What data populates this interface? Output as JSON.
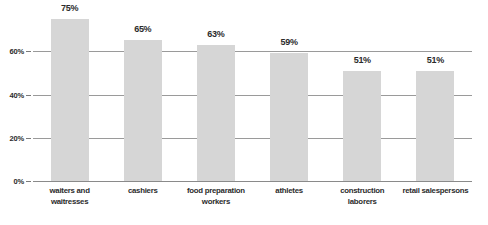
{
  "chart_data": {
    "type": "bar",
    "title": "",
    "subtitle": "",
    "xlabel": "",
    "ylabel": "",
    "categories": [
      "waiters and waitresses",
      "cashiers",
      "food preparation workers",
      "athletes",
      "construction laborers",
      "retail salespersons"
    ],
    "category_lines": [
      [
        "waiters and",
        "waitresses"
      ],
      [
        "cashiers"
      ],
      [
        "food preparation",
        "workers"
      ],
      [
        "athletes"
      ],
      [
        "construction",
        "laborers"
      ],
      [
        "retail salespersons"
      ]
    ],
    "values": [
      75,
      65,
      63,
      59,
      51,
      51
    ],
    "value_labels": [
      "75%",
      "65%",
      "63%",
      "59%",
      "51%",
      "51%"
    ],
    "ylim": [
      0,
      80
    ],
    "yticks": [
      0,
      20,
      40,
      60
    ],
    "ytick_labels": [
      "0%",
      "20%",
      "40%",
      "60%"
    ],
    "grid": true,
    "legend": "none",
    "colors": {
      "bar_fill": "#d6d6d6",
      "gridline": "#9a9a9a",
      "baseline": "#8a8a8a",
      "text": "#2b2b2b",
      "background": "#ffffff"
    }
  }
}
